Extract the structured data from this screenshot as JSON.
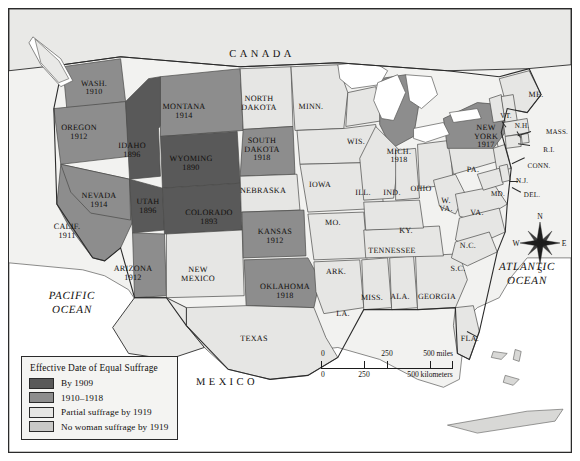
{
  "legend": {
    "title": "Effective Date of Equal Suffrage",
    "items": [
      {
        "label": "By 1909",
        "color": "#595959"
      },
      {
        "label": "1910–1918",
        "color": "#8d8d8d"
      },
      {
        "label": "Partial suffrage by 1919",
        "color": "#e6e6e4"
      },
      {
        "label": "No woman suffrage by 1919",
        "color": "#c9c9c7"
      }
    ]
  },
  "scalebar": {
    "miles": {
      "ticks": [
        "0",
        "250",
        "500 miles"
      ]
    },
    "kilometers": {
      "ticks": [
        "0",
        "250",
        "500 kilometers"
      ]
    }
  },
  "compass": {
    "north": "N",
    "east": "E",
    "south": "S",
    "west": "W"
  },
  "countries": [
    {
      "name": "CANADA",
      "x": 253,
      "y": 46
    },
    {
      "name": "MEXICO",
      "x": 218,
      "y": 374
    }
  ],
  "oceans": [
    {
      "name": "PACIFIC\nOCEAN",
      "x": 63,
      "y": 295
    },
    {
      "name": "ATLANTIC\nOCEAN",
      "x": 518,
      "y": 266
    }
  ],
  "states": [
    {
      "name": "WASH.",
      "date": "1910",
      "x": 85,
      "y": 79,
      "cls": "abbr"
    },
    {
      "name": "OREGON",
      "date": "1912",
      "x": 70,
      "y": 124,
      "cls": ""
    },
    {
      "name": "IDAHO",
      "date": "1896",
      "x": 123,
      "y": 142,
      "cls": ""
    },
    {
      "name": "MONTANA",
      "date": "1914",
      "x": 175,
      "y": 103,
      "cls": ""
    },
    {
      "name": "WYOMING",
      "date": "1890",
      "x": 182,
      "y": 155,
      "cls": ""
    },
    {
      "name": "NEVADA",
      "date": "1914",
      "x": 90,
      "y": 192,
      "cls": ""
    },
    {
      "name": "CALIF.",
      "date": "1911",
      "x": 58,
      "y": 223,
      "cls": ""
    },
    {
      "name": "UTAH",
      "date": "1896",
      "x": 139,
      "y": 198,
      "cls": ""
    },
    {
      "name": "COLORADO",
      "date": "1893",
      "x": 200,
      "y": 209,
      "cls": ""
    },
    {
      "name": "ARIZONA",
      "date": "1912",
      "x": 124,
      "y": 265,
      "cls": ""
    },
    {
      "name": "NEW\nMEXICO",
      "date": "",
      "x": 189,
      "y": 266,
      "cls": ""
    },
    {
      "name": "NORTH\nDAKOTA",
      "date": "",
      "x": 250,
      "y": 95,
      "cls": ""
    },
    {
      "name": "SOUTH\nDAKOTA",
      "date": "1918",
      "x": 253,
      "y": 141,
      "cls": ""
    },
    {
      "name": "NEBRASKA",
      "date": "",
      "x": 254,
      "y": 182,
      "cls": ""
    },
    {
      "name": "KANSAS",
      "date": "1912",
      "x": 266,
      "y": 228,
      "cls": ""
    },
    {
      "name": "OKLAHOMA",
      "date": "1918",
      "x": 276,
      "y": 283,
      "cls": ""
    },
    {
      "name": "TEXAS",
      "date": "",
      "x": 245,
      "y": 330,
      "cls": ""
    },
    {
      "name": "MINN.",
      "date": "",
      "x": 302,
      "y": 98,
      "cls": "abbr"
    },
    {
      "name": "IOWA",
      "date": "",
      "x": 311,
      "y": 176,
      "cls": "abbr"
    },
    {
      "name": "WIS.",
      "date": "",
      "x": 347,
      "y": 133,
      "cls": "abbr"
    },
    {
      "name": "MO.",
      "date": "",
      "x": 324,
      "y": 214,
      "cls": "abbr"
    },
    {
      "name": "ARK.",
      "date": "",
      "x": 327,
      "y": 263,
      "cls": "abbr"
    },
    {
      "name": "LA.",
      "date": "",
      "x": 334,
      "y": 305,
      "cls": "abbr"
    },
    {
      "name": "MISS.",
      "date": "",
      "x": 363,
      "y": 289,
      "cls": "abbr"
    },
    {
      "name": "ALA.",
      "date": "",
      "x": 391,
      "y": 288,
      "cls": "abbr"
    },
    {
      "name": "GEORGIA",
      "date": "",
      "x": 428,
      "y": 288,
      "cls": "abbr"
    },
    {
      "name": "TENNESSEE",
      "date": "",
      "x": 383,
      "y": 242,
      "cls": "abbr"
    },
    {
      "name": "ILL.",
      "date": "",
      "x": 354,
      "y": 184,
      "cls": "abbr"
    },
    {
      "name": "IND.",
      "date": "",
      "x": 383,
      "y": 184,
      "cls": "abbr"
    },
    {
      "name": "MICH.",
      "date": "1918",
      "x": 390,
      "y": 147,
      "cls": "abbr"
    },
    {
      "name": "OHIO",
      "date": "",
      "x": 412,
      "y": 180,
      "cls": "abbr"
    },
    {
      "name": "KY.",
      "date": "",
      "x": 397,
      "y": 222,
      "cls": "abbr"
    },
    {
      "name": "W.\nVA.",
      "date": "",
      "x": 437,
      "y": 196,
      "cls": "abbr"
    },
    {
      "name": "VA.",
      "date": "",
      "x": 468,
      "y": 204,
      "cls": "abbr"
    },
    {
      "name": "N.C.",
      "date": "",
      "x": 459,
      "y": 237,
      "cls": "abbr"
    },
    {
      "name": "S.C.",
      "date": "",
      "x": 449,
      "y": 260,
      "cls": "abbr"
    },
    {
      "name": "FLA.",
      "date": "",
      "x": 461,
      "y": 330,
      "cls": "abbr"
    },
    {
      "name": "PA.",
      "date": "",
      "x": 464,
      "y": 161,
      "cls": "abbr"
    },
    {
      "name": "NEW\nYORK",
      "date": "1917",
      "x": 477,
      "y": 128,
      "cls": ""
    },
    {
      "name": "ME.",
      "date": "",
      "x": 527,
      "y": 86,
      "cls": "abbr"
    },
    {
      "name": "VT.",
      "date": "",
      "x": 497,
      "y": 108,
      "cls": "tiny"
    },
    {
      "name": "N.H.",
      "date": "",
      "x": 513,
      "y": 118,
      "cls": "tiny"
    },
    {
      "name": "MASS.",
      "date": "",
      "x": 548,
      "y": 124,
      "cls": "tiny"
    },
    {
      "name": "R.I.",
      "date": "",
      "x": 540,
      "y": 142,
      "cls": "tiny"
    },
    {
      "name": "CONN.",
      "date": "",
      "x": 530,
      "y": 158,
      "cls": "tiny"
    },
    {
      "name": "N.J.",
      "date": "",
      "x": 513,
      "y": 173,
      "cls": "tiny"
    },
    {
      "name": "MD.",
      "date": "",
      "x": 489,
      "y": 186,
      "cls": "tiny"
    },
    {
      "name": "DEL.",
      "date": "",
      "x": 523,
      "y": 187,
      "cls": "tiny"
    }
  ]
}
